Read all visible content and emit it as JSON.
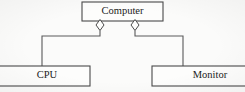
{
  "diagram": {
    "type": "uml-aggregation-diagram",
    "canvas": {
      "width": 245,
      "height": 92,
      "background": "#fbfbfa"
    },
    "line_color": "#5a5a5a",
    "text_color": "#1b1b1b",
    "nodes": [
      {
        "id": "computer",
        "label": "Computer",
        "x": 82,
        "y": 2,
        "width": 81,
        "height": 19,
        "label_x": 122.5,
        "label_y": 11.5,
        "clipped": false
      },
      {
        "id": "cpu",
        "label": "CPU",
        "x": -9,
        "y": 66,
        "width": 99,
        "height": 20,
        "label_x": 47,
        "label_y": 76,
        "clipped": "left"
      },
      {
        "id": "monitor",
        "label": "Monitor",
        "x": 152,
        "y": 66,
        "width": 101,
        "height": 20,
        "label_x": 210,
        "label_y": 76,
        "clipped": "right"
      }
    ],
    "diamonds": [
      {
        "id": "aggregation-diamond-cpu",
        "cx": 100,
        "cy": 25,
        "rx": 4,
        "ry": 5.5
      },
      {
        "id": "aggregation-diamond-monitor",
        "cx": 135,
        "cy": 25,
        "rx": 4,
        "ry": 5.5
      }
    ],
    "connectors": [
      {
        "id": "connector-computer-cpu",
        "from": "computer",
        "to": "cpu",
        "path": "M 100 30.5 L 100 36 L 42 36 L 42 66"
      },
      {
        "id": "connector-computer-monitor",
        "from": "computer",
        "to": "monitor",
        "path": "M 135 30.5 L 135 36 L 183 36 L 183 66"
      }
    ]
  }
}
